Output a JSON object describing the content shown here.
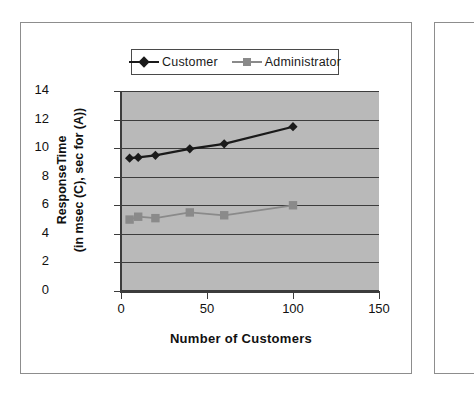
{
  "chart_data": {
    "type": "line",
    "title": "",
    "xlabel": "Number of Customers",
    "ylabel_line1": "ResponseTime",
    "ylabel_line2": "(in msec (C), sec for (A))",
    "xlim": [
      0,
      150
    ],
    "ylim": [
      0,
      14
    ],
    "xticks": [
      0,
      50,
      100,
      150
    ],
    "yticks": [
      0,
      2,
      4,
      6,
      8,
      10,
      12,
      14
    ],
    "grid": true,
    "legend_position": "top",
    "x": [
      5,
      10,
      20,
      40,
      60,
      100
    ],
    "series": [
      {
        "name": "Customer",
        "marker": "diamond",
        "color": "#1a1a1a",
        "values": [
          9.3,
          9.35,
          9.5,
          9.95,
          10.3,
          11.5
        ]
      },
      {
        "name": "Administrator",
        "marker": "square",
        "color": "#8a8a8a",
        "values": [
          5.0,
          5.2,
          5.1,
          5.5,
          5.3,
          6.0
        ]
      }
    ]
  },
  "legend": {
    "entries": [
      {
        "label": "Customer"
      },
      {
        "label": "Administrator"
      }
    ]
  },
  "colors": {
    "plot_background": "#b9b9b9",
    "gridline": "#3c3c3c",
    "axis": "#3c3c3c",
    "page_background": "#ffffff",
    "frame_border": "#8d8d8d",
    "customer": "#1a1a1a",
    "administrator": "#8a8a8a"
  }
}
